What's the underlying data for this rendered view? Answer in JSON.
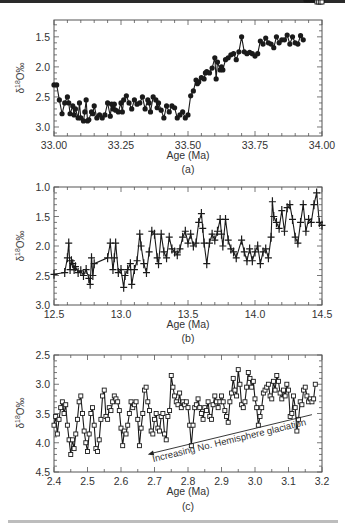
{
  "chart_data": [
    {
      "type": "line",
      "panel_label": "(a)",
      "xlabel": "Age (Ma)",
      "ylabel": "δ18O‰",
      "xlim": [
        33.0,
        34.0
      ],
      "ylim": [
        3.15,
        1.22
      ],
      "y_inverted": true,
      "xticks": [
        "33.00",
        "33.25",
        "33.50",
        "33.75",
        "34.00"
      ],
      "yticks": [
        "1.5",
        "2.0",
        "2.5",
        "3.0"
      ],
      "marker": "filled-circle",
      "grid": false,
      "x": [
        33.0,
        33.01,
        33.02,
        33.03,
        33.04,
        33.05,
        33.055,
        33.06,
        33.07,
        33.075,
        33.08,
        33.09,
        33.095,
        33.1,
        33.11,
        33.115,
        33.12,
        33.125,
        33.13,
        33.14,
        33.145,
        33.15,
        33.16,
        33.17,
        33.18,
        33.19,
        33.2,
        33.21,
        33.215,
        33.22,
        33.225,
        33.23,
        33.24,
        33.25,
        33.255,
        33.26,
        33.27,
        33.28,
        33.29,
        33.3,
        33.31,
        33.32,
        33.33,
        33.34,
        33.35,
        33.355,
        33.36,
        33.37,
        33.38,
        33.385,
        33.39,
        33.4,
        33.41,
        33.42,
        33.43,
        33.44,
        33.45,
        33.46,
        33.47,
        33.48,
        33.49,
        33.5,
        33.51,
        33.52,
        33.53,
        33.535,
        33.54,
        33.55,
        33.56,
        33.565,
        33.57,
        33.58,
        33.59,
        33.6,
        33.605,
        33.61,
        33.62,
        33.625,
        33.63,
        33.64,
        33.65,
        33.66,
        33.67,
        33.68,
        33.69,
        33.7,
        33.71,
        33.72,
        33.73,
        33.74,
        33.75,
        33.76,
        33.77,
        33.78,
        33.79,
        33.8,
        33.81,
        33.82,
        33.83,
        33.84,
        33.85,
        33.86,
        33.87,
        33.88,
        33.89,
        33.9,
        33.91,
        33.92,
        33.93,
        33.94,
        33.95,
        33.96,
        33.97,
        33.98,
        33.99,
        34.0
      ],
      "y": [
        2.3,
        2.3,
        2.55,
        2.78,
        2.6,
        2.5,
        2.6,
        2.78,
        2.65,
        2.8,
        2.7,
        2.85,
        2.6,
        2.85,
        2.9,
        2.75,
        2.55,
        2.9,
        2.88,
        2.75,
        2.78,
        2.65,
        2.85,
        2.8,
        2.85,
        2.8,
        2.6,
        2.82,
        2.62,
        2.7,
        2.62,
        2.72,
        2.75,
        2.6,
        2.75,
        2.55,
        2.48,
        2.6,
        2.7,
        2.55,
        2.62,
        2.6,
        2.5,
        2.7,
        2.55,
        2.6,
        2.75,
        2.5,
        2.55,
        2.68,
        2.6,
        2.72,
        2.85,
        2.65,
        2.75,
        2.65,
        2.68,
        2.85,
        2.8,
        2.75,
        2.85,
        2.8,
        2.48,
        2.4,
        2.22,
        2.28,
        2.25,
        2.18,
        2.2,
        2.1,
        2.08,
        2.1,
        2.02,
        1.85,
        2.2,
        1.92,
        2.05,
        2.0,
        2.05,
        1.88,
        1.85,
        1.8,
        1.78,
        1.88,
        1.75,
        1.5,
        1.75,
        1.78,
        1.76,
        1.78,
        1.82,
        1.78,
        1.57,
        1.62,
        1.52,
        1.6,
        1.62,
        1.68,
        1.5,
        1.6,
        1.55,
        1.55,
        1.47,
        1.62,
        1.5,
        1.6,
        1.62,
        1.48,
        1.55
      ]
    },
    {
      "type": "line",
      "panel_label": "(b)",
      "xlabel": "Age (Ma)",
      "ylabel": "δ18O‰",
      "xlim": [
        12.5,
        14.5
      ],
      "ylim": [
        3.0,
        1.0
      ],
      "y_inverted": true,
      "xticks": [
        "12.5",
        "13.0",
        "13.5",
        "14.0",
        "14.5"
      ],
      "yticks": [
        "1.0",
        "1.5",
        "2.0",
        "2.5",
        "3.0"
      ],
      "marker": "plus",
      "grid": false,
      "x": [
        12.5,
        12.58,
        12.6,
        12.61,
        12.62,
        12.63,
        12.64,
        12.65,
        12.66,
        12.68,
        12.7,
        12.72,
        12.74,
        12.76,
        12.77,
        12.78,
        12.79,
        12.8,
        12.9,
        12.92,
        12.94,
        12.95,
        12.96,
        12.98,
        13.0,
        13.02,
        13.03,
        13.05,
        13.07,
        13.08,
        13.1,
        13.12,
        13.14,
        13.15,
        13.17,
        13.19,
        13.21,
        13.23,
        13.25,
        13.27,
        13.28,
        13.3,
        13.32,
        13.34,
        13.36,
        13.38,
        13.4,
        13.42,
        13.44,
        13.46,
        13.48,
        13.5,
        13.52,
        13.54,
        13.56,
        13.58,
        13.6,
        13.61,
        13.62,
        13.64,
        13.66,
        13.68,
        13.7,
        13.72,
        13.74,
        13.75,
        13.76,
        13.78,
        13.8,
        13.82,
        13.84,
        13.86,
        13.9,
        13.92,
        13.94,
        13.96,
        13.98,
        14.0,
        14.02,
        14.04,
        14.06,
        14.08,
        14.1,
        14.12,
        14.13,
        14.14,
        14.16,
        14.18,
        14.2,
        14.22,
        14.24,
        14.26,
        14.28,
        14.3,
        14.32,
        14.34,
        14.36,
        14.38,
        14.4,
        14.42,
        14.44,
        14.46,
        14.48,
        14.5
      ],
      "y": [
        2.48,
        2.45,
        2.2,
        1.95,
        2.4,
        2.25,
        2.3,
        2.4,
        2.35,
        2.45,
        2.42,
        2.5,
        2.4,
        2.55,
        2.65,
        2.2,
        2.5,
        2.3,
        2.2,
        1.95,
        2.4,
        2.2,
        1.95,
        2.45,
        2.4,
        2.7,
        2.5,
        2.4,
        2.3,
        2.65,
        2.4,
        2.25,
        1.8,
        2.0,
        2.3,
        2.45,
        2.1,
        1.75,
        1.8,
        2.2,
        2.3,
        1.8,
        2.1,
        2.2,
        1.85,
        2.05,
        2.1,
        2.15,
        2.05,
        1.85,
        1.75,
        1.95,
        1.8,
        2.0,
        1.95,
        1.6,
        1.45,
        1.7,
        1.95,
        2.3,
        1.95,
        1.8,
        1.9,
        1.75,
        1.55,
        1.8,
        2.0,
        1.55,
        1.9,
        2.05,
        2.1,
        2.2,
        1.9,
        2.1,
        2.25,
        2.05,
        2.25,
        2.1,
        2.0,
        2.3,
        2.1,
        2.05,
        2.2,
        1.85,
        1.25,
        1.5,
        1.6,
        1.7,
        1.4,
        1.75,
        1.35,
        1.3,
        1.55,
        1.85,
        1.95,
        1.6,
        1.3,
        1.75,
        1.55,
        1.6,
        1.3,
        1.1,
        1.6,
        1.65
      ]
    },
    {
      "type": "line",
      "panel_label": "(c)",
      "xlabel": "Age (Ma)",
      "ylabel": "δ18O‰",
      "xlim": [
        2.4,
        3.2
      ],
      "ylim": [
        4.5,
        2.5
      ],
      "y_inverted": true,
      "xticks": [
        "2.4",
        "2.5",
        "2.6",
        "2.7",
        "2.8",
        "2.9",
        "3.0",
        "3.1",
        "3.2"
      ],
      "yticks": [
        "2.5",
        "3.0",
        "3.5",
        "4.0",
        "4.5"
      ],
      "marker": "open-square",
      "grid": false,
      "annotation": {
        "text": "Increasing No. Hemisphere glaciation",
        "arrow_from": [
          3.17,
          3.52
        ],
        "arrow_to": [
          2.68,
          4.2
        ]
      },
      "x": [
        2.4,
        2.405,
        2.41,
        2.415,
        2.42,
        2.425,
        2.43,
        2.435,
        2.44,
        2.445,
        2.45,
        2.455,
        2.46,
        2.465,
        2.47,
        2.475,
        2.48,
        2.485,
        2.49,
        2.495,
        2.5,
        2.505,
        2.51,
        2.515,
        2.52,
        2.525,
        2.53,
        2.535,
        2.54,
        2.545,
        2.55,
        2.555,
        2.56,
        2.565,
        2.57,
        2.575,
        2.58,
        2.585,
        2.59,
        2.595,
        2.6,
        2.605,
        2.61,
        2.615,
        2.62,
        2.625,
        2.63,
        2.635,
        2.64,
        2.645,
        2.65,
        2.655,
        2.66,
        2.665,
        2.67,
        2.675,
        2.68,
        2.685,
        2.69,
        2.695,
        2.7,
        2.705,
        2.71,
        2.715,
        2.72,
        2.725,
        2.73,
        2.735,
        2.74,
        2.745,
        2.75,
        2.755,
        2.76,
        2.765,
        2.77,
        2.775,
        2.78,
        2.785,
        2.79,
        2.795,
        2.8,
        2.805,
        2.81,
        2.815,
        2.82,
        2.825,
        2.83,
        2.835,
        2.84,
        2.845,
        2.85,
        2.855,
        2.86,
        2.865,
        2.87,
        2.875,
        2.88,
        2.885,
        2.89,
        2.895,
        2.9,
        2.905,
        2.91,
        2.915,
        2.92,
        2.925,
        2.93,
        2.935,
        2.94,
        2.945,
        2.95,
        2.955,
        2.96,
        2.965,
        2.97,
        2.975,
        2.98,
        2.985,
        2.99,
        2.995,
        3.0,
        3.005,
        3.01,
        3.015,
        3.02,
        3.025,
        3.03,
        3.035,
        3.04,
        3.045,
        3.05,
        3.055,
        3.06,
        3.065,
        3.07,
        3.075,
        3.08,
        3.085,
        3.09,
        3.095,
        3.1,
        3.105,
        3.11,
        3.115,
        3.12,
        3.125,
        3.13,
        3.135,
        3.14,
        3.145,
        3.15,
        3.155,
        3.16,
        3.165,
        3.17,
        3.175,
        3.18,
        3.185,
        3.19,
        3.195,
        3.2
      ],
      "y": [
        3.7,
        3.55,
        3.85,
        3.6,
        3.4,
        3.3,
        3.5,
        3.35,
        3.7,
        3.95,
        4.2,
        3.95,
        4.1,
        3.85,
        3.6,
        3.3,
        3.2,
        3.5,
        3.8,
        4.0,
        4.15,
        3.85,
        3.5,
        3.4,
        3.7,
        4.1,
        4.15,
        3.95,
        3.6,
        3.2,
        3.1,
        3.55,
        3.6,
        3.4,
        3.45,
        3.3,
        3.2,
        3.25,
        3.3,
        3.45,
        3.75,
        4.05,
        3.8,
        3.85,
        3.7,
        3.5,
        3.3,
        3.4,
        3.35,
        3.3,
        3.6,
        4.05,
        3.75,
        3.5,
        3.1,
        3.05,
        3.3,
        3.45,
        3.8,
        3.85,
        3.6,
        3.5,
        3.75,
        3.8,
        3.55,
        3.5,
        3.85,
        3.95,
        3.55,
        3.45,
        2.85,
        3.05,
        3.2,
        3.3,
        3.35,
        3.15,
        3.4,
        3.3,
        3.35,
        3.3,
        3.4,
        3.7,
        4.05,
        3.7,
        3.4,
        3.35,
        3.25,
        3.4,
        3.5,
        3.6,
        3.4,
        3.45,
        3.3,
        3.55,
        3.6,
        3.35,
        3.2,
        3.3,
        3.4,
        3.3,
        3.2,
        3.3,
        3.45,
        3.55,
        3.65,
        3.3,
        3.15,
        2.9,
        3.1,
        3.2,
        2.75,
        3.0,
        3.35,
        3.4,
        3.3,
        3.05,
        2.8,
        2.9,
        3.05,
        2.95,
        3.25,
        3.4,
        3.7,
        3.55,
        3.4,
        3.15,
        3.1,
        3.05,
        3.0,
        3.2,
        3.25,
        2.95,
        3.1,
        2.85,
        2.95,
        3.15,
        3.25,
        3.1,
        3.2,
        3.0,
        3.1,
        3.55,
        3.5,
        3.2,
        3.4,
        3.8,
        3.6,
        3.3,
        3.35,
        3.1,
        3.05,
        3.2,
        3.3,
        3.25,
        3.3,
        3.25,
        3.0
      ]
    }
  ],
  "panels": {
    "a": {
      "label": "(a)",
      "xlabel": "Age (Ma)",
      "ylabel_main": "δ",
      "ylabel_sup": "18",
      "ylabel_tail": "O‰"
    },
    "b": {
      "label": "(b)",
      "xlabel": "Age (Ma)",
      "ylabel_main": "δ",
      "ylabel_sup": "18",
      "ylabel_tail": "O‰"
    },
    "c": {
      "label": "(c)",
      "xlabel": "Age (Ma)",
      "ylabel_main": "δ",
      "ylabel_sup": "18",
      "ylabel_tail": "O‰",
      "annotation": "Increasing No. Hemisphere glaciation"
    }
  },
  "colors": {
    "line": "#1a1a1a",
    "frame": "#555555",
    "text": "#333333"
  }
}
